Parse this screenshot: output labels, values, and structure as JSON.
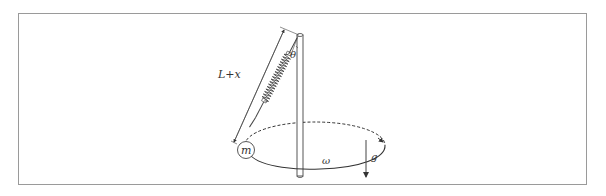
{
  "figure": {
    "labels": {
      "length": "L+x",
      "angle": "θ",
      "mass": "m",
      "angular_velocity": "ω",
      "gravity": "g"
    },
    "colors": {
      "stroke": "#333333",
      "frame": "#9a9a9a",
      "background": "#ffffff"
    }
  }
}
